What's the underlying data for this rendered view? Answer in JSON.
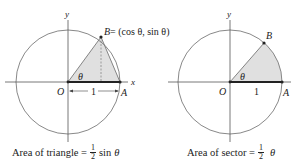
{
  "colors": {
    "circle": "#7a7a7a",
    "axis": "#555555",
    "fill": "#e0e0e0",
    "thick_line": "#222222",
    "text": "#222222"
  },
  "left_figure": {
    "axis_y_label": "y",
    "axis_x_label": "x",
    "origin_label": "O",
    "point_a_label": "A",
    "point_b_label": "B = (cos θ, sin θ)",
    "point_b_name": "B",
    "point_b_coords": "= (cos θ, sin θ)",
    "angle_label": "θ",
    "radius_label": "1",
    "shaded_region": "triangle OAB",
    "caption": {
      "text": "Area of triangle =",
      "fraction_numerator": "1",
      "fraction_denominator": "2",
      "suffix": "sin",
      "variable": "θ"
    }
  },
  "right_figure": {
    "axis_y_label": "y",
    "axis_x_label": "x",
    "origin_label": "O",
    "point_a_label": "A",
    "point_b_label": "B",
    "angle_label": "θ",
    "radius_label": "1",
    "shaded_region": "sector OAB",
    "caption": {
      "text": "Area of sector =",
      "fraction_numerator": "1",
      "fraction_denominator": "2",
      "variable": "θ"
    }
  }
}
